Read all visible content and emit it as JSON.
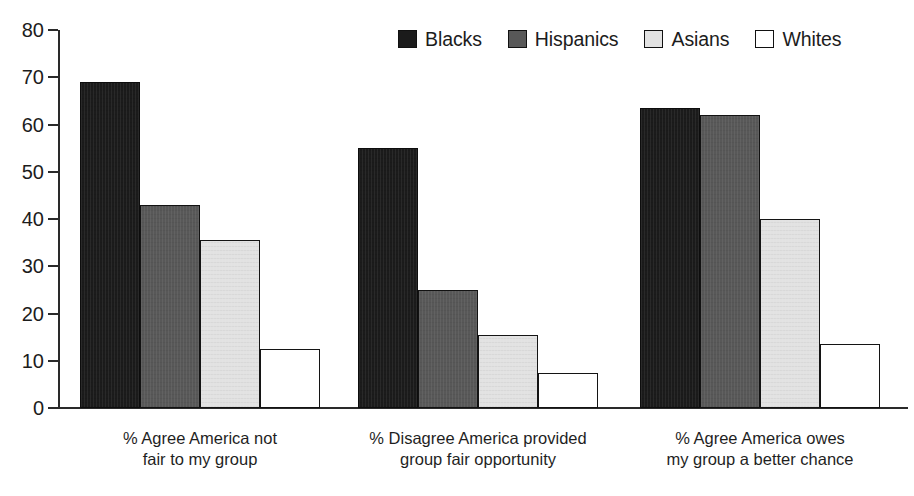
{
  "chart_data": {
    "type": "bar",
    "title": "",
    "subtitle": "",
    "xlabel": "",
    "ylabel": "",
    "ylim": [
      0,
      80
    ],
    "yticks": [
      0,
      10,
      20,
      30,
      40,
      50,
      60,
      70,
      80
    ],
    "ytick_labels": [
      "0",
      "10",
      "20",
      "30",
      "40",
      "50",
      "60",
      "70",
      "80"
    ],
    "grid": false,
    "legend_position": "top-right",
    "categories": [
      "% Agree America not\nfair to my group",
      "% Disagree America provided\ngroup fair opportunity",
      "% Agree America owes\nmy group a better chance"
    ],
    "series": [
      {
        "name": "Blacks",
        "color": "#1b1b1b",
        "values": [
          69,
          55,
          63.5
        ]
      },
      {
        "name": "Hispanics",
        "color": "#585858",
        "values": [
          43,
          25,
          62
        ]
      },
      {
        "name": "Asians",
        "color": "#e2e2e2",
        "values": [
          35.5,
          15.5,
          40
        ]
      },
      {
        "name": "Whites",
        "color": "#ffffff",
        "values": [
          12.5,
          7.5,
          13.5
        ]
      }
    ]
  },
  "legend": {
    "items": [
      {
        "label": "Blacks",
        "swatch": "swatch-blacks"
      },
      {
        "label": "Hispanics",
        "swatch": "swatch-hispanics"
      },
      {
        "label": "Asians",
        "swatch": "swatch-asians"
      },
      {
        "label": "Whites",
        "swatch": "swatch-whites"
      }
    ]
  }
}
